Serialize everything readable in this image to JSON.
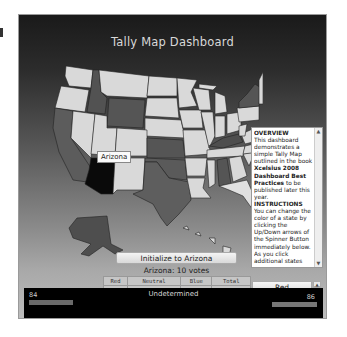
{
  "header": {
    "title": "Tally Map Dashboard"
  },
  "map": {
    "hover_tooltip": "Arizona",
    "state_colors": {
      "red": "#5a5a5a",
      "blue": "#4c4c4c",
      "neutral": "#d9d9d9",
      "selected": "#0a0a0a"
    }
  },
  "info_panel": {
    "overview_heading": "OVERVIEW",
    "overview_text_1": "This dashboard demonstrates a simple Tally Map outlined in the book ",
    "overview_book": "Xcelsius 2008 Dashboard Best Practices",
    "overview_text_2": " to be published later this year.",
    "instructions_heading": "INSTRUCTIONS",
    "instructions_text": "You can change the color of a state by clicking the Up/Down arrows of the Spinner Button immediately below. As you click additional states the colors of the states are automatically"
  },
  "controls": {
    "init_button": "Initialize to Arizona",
    "selected_state_votes": "Arizona: 10 votes",
    "spinner_value": "Red"
  },
  "tally_table": {
    "headers": [
      "Red",
      "Neutral",
      "Blue",
      "Total"
    ],
    "values": [
      "84",
      "368",
      "86",
      "538"
    ]
  },
  "bottom_bar": {
    "left_value": "84",
    "center_label": "Undetermined",
    "right_value": "86"
  }
}
